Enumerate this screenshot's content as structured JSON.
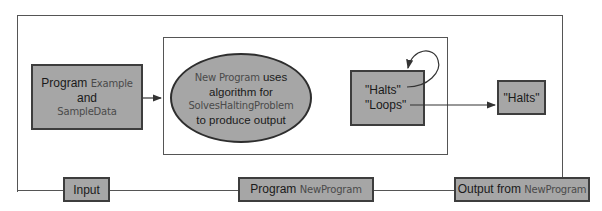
{
  "diagram": {
    "input_box": {
      "line1_plain": "Program",
      "line1_code": "Example",
      "line2": "and",
      "line3_code": "SampleData"
    },
    "ellipse": {
      "line1_code": "New Program",
      "line1_plain": "uses",
      "line2": "algorithm for",
      "line3_code": "SolvesHaltingProblem",
      "line4": "to produce output"
    },
    "decision_box": {
      "halts": "\"Halts\"",
      "loops": "\"Loops\""
    },
    "result_box": {
      "label": "\"Halts\""
    },
    "bottom_labels": {
      "input": "Input",
      "program_plain": "Program",
      "program_code": "NewProgram",
      "output_plain": "Output from",
      "output_code": "NewProgram"
    },
    "colors": {
      "box_fill": "#a6a6a6",
      "box_border": "#3d3d3d",
      "line": "#555555",
      "code_text": "#4a4a4a"
    }
  }
}
